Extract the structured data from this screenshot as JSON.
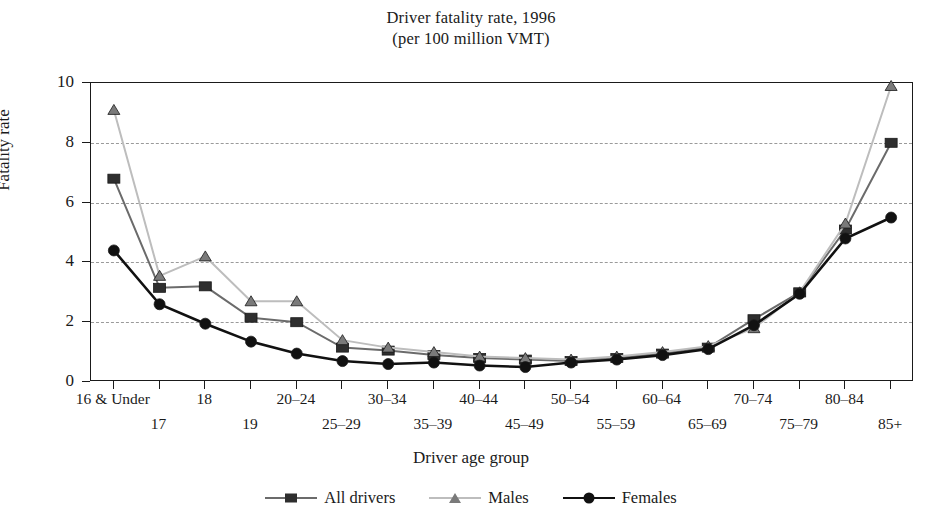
{
  "chart_data": {
    "type": "line",
    "title": "Driver fatality rate, 1996",
    "subtitle": "(per 100 million VMT)",
    "xlabel": "Driver age group",
    "ylabel": "Fatality rate",
    "ylim": [
      0,
      10
    ],
    "yticks": [
      0,
      2,
      4,
      6,
      8,
      10
    ],
    "grid": "horizontal-dashed",
    "legend_position": "bottom-center",
    "categories": [
      "16 & Under",
      "17",
      "18",
      "19",
      "20–24",
      "25–29",
      "30–34",
      "35–39",
      "40–44",
      "45–49",
      "50–54",
      "55–59",
      "60–64",
      "65–69",
      "70–74",
      "75–79",
      "80–84",
      "85+"
    ],
    "series": [
      {
        "name": "All drivers",
        "marker": "square",
        "color": "#6b6b6b",
        "marker_color": "#2e2e2e",
        "values": [
          6.8,
          3.15,
          3.2,
          2.15,
          2.0,
          1.15,
          1.05,
          0.9,
          0.8,
          0.75,
          0.7,
          0.8,
          0.95,
          1.15,
          2.1,
          3.0,
          5.1,
          8.0
        ]
      },
      {
        "name": "Males",
        "marker": "triangle",
        "color": "#bdbdbd",
        "marker_color": "#7a7a7a",
        "values": [
          9.1,
          3.55,
          4.2,
          2.7,
          2.7,
          1.4,
          1.15,
          1.0,
          0.85,
          0.8,
          0.75,
          0.85,
          1.0,
          1.2,
          1.8,
          3.0,
          5.3,
          9.9
        ]
      },
      {
        "name": "Females",
        "marker": "circle",
        "color": "#111111",
        "marker_color": "#111111",
        "values": [
          4.4,
          2.6,
          1.95,
          1.35,
          0.95,
          0.7,
          0.6,
          0.65,
          0.55,
          0.5,
          0.65,
          0.75,
          0.9,
          1.1,
          1.9,
          2.95,
          4.8,
          5.5
        ]
      }
    ]
  }
}
